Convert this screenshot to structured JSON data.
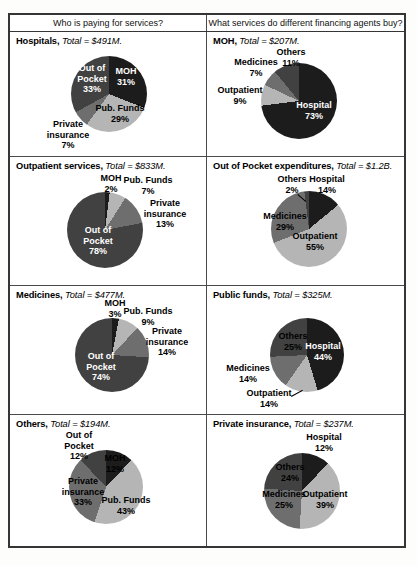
{
  "header": {
    "left": "Who is paying for services?",
    "right": "What services do different financing agents buy?"
  },
  "palette": {
    "black": "#1c1c1c",
    "dark": "#414141",
    "medium": "#6e6e6e",
    "light": "#b5b5b5",
    "white_text": "#ffffff",
    "black_text": "#000000"
  },
  "chart_data": [
    {
      "type": "pie",
      "id": "hospitals",
      "title": "Hospitals",
      "total_label": "Total = $491M.",
      "pie": {
        "cx": 99,
        "cy": 62,
        "r": 38
      },
      "slices": [
        {
          "label": "MOH",
          "value": 31,
          "pct_text": "31%",
          "color": "black",
          "text": {
            "lines": [
              "MOH",
              "31%"
            ],
            "x": 116,
            "y": 44,
            "color": "#ffffff"
          }
        },
        {
          "label": "Pub. Funds",
          "value": 29,
          "pct_text": "29%",
          "color": "light",
          "text": {
            "lines": [
              "Pub. Funds",
              "29%"
            ],
            "x": 110,
            "y": 81,
            "color": "#000000"
          }
        },
        {
          "label": "Private insurance",
          "value": 7,
          "pct_text": "7%",
          "color": "medium",
          "text": {
            "lines": [
              "Private",
              "insurance",
              "7%"
            ],
            "x": 58,
            "y": 103,
            "color": "#000000"
          }
        },
        {
          "label": "Out of Pocket",
          "value": 33,
          "pct_text": "33%",
          "color": "dark",
          "text": {
            "lines": [
              "Out of",
              "Pocket",
              "33%"
            ],
            "x": 82,
            "y": 47,
            "color": "#ffffff"
          }
        }
      ]
    },
    {
      "type": "pie",
      "id": "moh",
      "title": "MOH",
      "total_label": "Total = $207M.",
      "pie": {
        "cx": 92,
        "cy": 69,
        "r": 38
      },
      "slices": [
        {
          "label": "Hospital",
          "value": 73,
          "pct_text": "73%",
          "color": "black",
          "text": {
            "lines": [
              "Hospital",
              "73%"
            ],
            "x": 107,
            "y": 78,
            "color": "#ffffff"
          }
        },
        {
          "label": "Outpatient",
          "value": 9,
          "pct_text": "9%",
          "color": "light",
          "text": {
            "lines": [
              "Outpatient",
              "9%"
            ],
            "x": 33,
            "y": 63,
            "color": "#000000"
          }
        },
        {
          "label": "Medicines",
          "value": 7,
          "pct_text": "7%",
          "color": "medium",
          "text": {
            "lines": [
              "Medicines",
              "7%"
            ],
            "x": 49,
            "y": 35,
            "color": "#000000"
          }
        },
        {
          "label": "Others",
          "value": 11,
          "pct_text": "11%",
          "color": "dark",
          "text": {
            "lines": [
              "Others",
              "11%"
            ],
            "x": 84,
            "y": 25,
            "color": "#000000"
          }
        }
      ]
    },
    {
      "type": "pie",
      "id": "outpatient-services",
      "title": "Outpatient services",
      "total_label": "Total = $833M.",
      "pie": {
        "cx": 95,
        "cy": 73,
        "r": 38
      },
      "slices": [
        {
          "label": "MOH",
          "value": 2,
          "pct_text": "2%",
          "color": "black",
          "text": {
            "lines": [
              "MOH",
              "2%"
            ],
            "x": 101,
            "y": 26,
            "color": "#000000"
          }
        },
        {
          "label": "Pub. Funds",
          "value": 7,
          "pct_text": "7%",
          "color": "light",
          "text": {
            "lines": [
              "Pub. Funds",
              "7%"
            ],
            "x": 138,
            "y": 28,
            "color": "#000000"
          }
        },
        {
          "label": "Private insurance",
          "value": 13,
          "pct_text": "13%",
          "color": "medium",
          "text": {
            "lines": [
              "Private",
              "insurance",
              "13%"
            ],
            "x": 155,
            "y": 57,
            "color": "#000000"
          }
        },
        {
          "label": "Out of Pocket",
          "value": 78,
          "pct_text": "78%",
          "color": "dark",
          "text": {
            "lines": [
              "Out of",
              "Pocket",
              "78%"
            ],
            "x": 88,
            "y": 84,
            "color": "#ffffff"
          }
        }
      ]
    },
    {
      "type": "pie",
      "id": "out-of-pocket",
      "title": "Out of Pocket expenditures",
      "total_label": "Total = $1.2B.",
      "pie": {
        "cx": 102,
        "cy": 72,
        "r": 38
      },
      "slices": [
        {
          "label": "Hospital",
          "value": 14,
          "pct_text": "14%",
          "color": "black",
          "text": {
            "lines": [
              "Hospital",
              "14%"
            ],
            "x": 120,
            "y": 27,
            "color": "#000000"
          }
        },
        {
          "label": "Outpatient",
          "value": 55,
          "pct_text": "55%",
          "color": "light",
          "text": {
            "lines": [
              "Outpatient",
              "55%"
            ],
            "x": 108,
            "y": 84,
            "color": "#000000"
          }
        },
        {
          "label": "Medicines",
          "value": 29,
          "pct_text": "29%",
          "color": "medium",
          "text": {
            "lines": [
              "Medicines",
              "29%"
            ],
            "x": 78,
            "y": 64,
            "color": "#000000"
          }
        },
        {
          "label": "Others",
          "value": 2,
          "pct_text": "2%",
          "color": "dark",
          "text": {
            "lines": [
              "Others",
              "2%"
            ],
            "x": 85,
            "y": 27,
            "color": "#000000"
          },
          "leader": {
            "x1": 91,
            "y1": 37,
            "x2": 99,
            "y2": 44
          }
        }
      ]
    },
    {
      "type": "pie",
      "id": "medicines",
      "title": "Medicines",
      "total_label": "Total = $477M.",
      "pie": {
        "cx": 102,
        "cy": 69,
        "r": 37
      },
      "slices": [
        {
          "label": "MOH",
          "value": 3,
          "pct_text": "3%",
          "color": "black",
          "text": {
            "lines": [
              "MOH",
              "3%"
            ],
            "x": 105,
            "y": 22,
            "color": "#000000"
          }
        },
        {
          "label": "Pub. Funds",
          "value": 9,
          "pct_text": "9%",
          "color": "light",
          "text": {
            "lines": [
              "Pub. Funds",
              "9%"
            ],
            "x": 138,
            "y": 30,
            "color": "#000000"
          }
        },
        {
          "label": "Private insurance",
          "value": 14,
          "pct_text": "14%",
          "color": "medium",
          "text": {
            "lines": [
              "Private",
              "insurance",
              "14%"
            ],
            "x": 157,
            "y": 56,
            "color": "#000000"
          }
        },
        {
          "label": "Out of Pocket",
          "value": 74,
          "pct_text": "74%",
          "color": "dark",
          "text": {
            "lines": [
              "Out of",
              "Pocket",
              "74%"
            ],
            "x": 91,
            "y": 81,
            "color": "#ffffff"
          }
        }
      ]
    },
    {
      "type": "pie",
      "id": "public-funds",
      "title": "Public funds",
      "total_label": "Total = $325M.",
      "pie": {
        "cx": 100,
        "cy": 69,
        "r": 37
      },
      "slices": [
        {
          "label": "Hospital",
          "value": 44,
          "pct_text": "44%",
          "color": "black",
          "text": {
            "lines": [
              "Hospital",
              "44%"
            ],
            "x": 116,
            "y": 65,
            "color": "#ffffff"
          }
        },
        {
          "label": "Outpatient",
          "value": 14,
          "pct_text": "14%",
          "color": "light",
          "text": {
            "lines": [
              "Outpatient",
              "14%"
            ],
            "x": 62,
            "y": 112,
            "color": "#000000"
          },
          "leader": {
            "x1": 84,
            "y1": 110,
            "x2": 95,
            "y2": 104
          }
        },
        {
          "label": "Medicines",
          "value": 14,
          "pct_text": "14%",
          "color": "medium",
          "text": {
            "lines": [
              "Medicines",
              "14%"
            ],
            "x": 41,
            "y": 87,
            "color": "#000000"
          }
        },
        {
          "label": "Others",
          "value": 25,
          "pct_text": "25%",
          "color": "dark",
          "text": {
            "lines": [
              "Others",
              "25%"
            ],
            "x": 86,
            "y": 55,
            "color": "#000000"
          }
        }
      ]
    },
    {
      "type": "pie",
      "id": "others",
      "title": "Others",
      "total_label": "Total = $194M.",
      "pie": {
        "cx": 96,
        "cy": 72,
        "r": 37
      },
      "slices": [
        {
          "label": "MOH",
          "value": 12,
          "pct_text": "12%",
          "color": "black",
          "text": {
            "lines": [
              "MOH",
              "12%"
            ],
            "x": 105,
            "y": 48,
            "color": "#000000"
          }
        },
        {
          "label": "Pub. Funds",
          "value": 43,
          "pct_text": "43%",
          "color": "light",
          "text": {
            "lines": [
              "Pub. Funds",
              "43%"
            ],
            "x": 116,
            "y": 90,
            "color": "#000000"
          }
        },
        {
          "label": "Private insurance",
          "value": 33,
          "pct_text": "33%",
          "color": "medium",
          "text": {
            "lines": [
              "Private",
              "insurance",
              "33%"
            ],
            "x": 73,
            "y": 77,
            "color": "#000000"
          }
        },
        {
          "label": "Out of Pocket",
          "value": 12,
          "pct_text": "12%",
          "color": "dark",
          "text": {
            "lines": [
              "Out of",
              "Pocket",
              "12%"
            ],
            "x": 69,
            "y": 31,
            "color": "#000000"
          }
        }
      ]
    },
    {
      "type": "pie",
      "id": "private-insurance",
      "title": "Private insurance",
      "total_label": "Total = $237M.",
      "pie": {
        "cx": 95,
        "cy": 76,
        "r": 38
      },
      "slices": [
        {
          "label": "Hospital",
          "value": 12,
          "pct_text": "12%",
          "color": "black",
          "text": {
            "lines": [
              "Hospital",
              "12%"
            ],
            "x": 117,
            "y": 27,
            "color": "#000000"
          }
        },
        {
          "label": "Outpatient",
          "value": 39,
          "pct_text": "39%",
          "color": "light",
          "text": {
            "lines": [
              "Outpatient",
              "39%"
            ],
            "x": 118,
            "y": 84,
            "color": "#000000"
          }
        },
        {
          "label": "Medicines",
          "value": 25,
          "pct_text": "25%",
          "color": "medium",
          "text": {
            "lines": [
              "Medicines",
              "25%"
            ],
            "x": 77,
            "y": 84,
            "color": "#000000"
          }
        },
        {
          "label": "Others",
          "value": 24,
          "pct_text": "24%",
          "color": "dark",
          "text": {
            "lines": [
              "Others",
              "24%"
            ],
            "x": 83,
            "y": 57,
            "color": "#000000"
          }
        }
      ]
    }
  ]
}
